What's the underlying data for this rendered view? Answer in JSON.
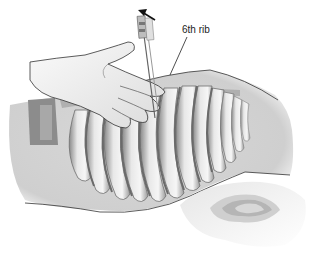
{
  "figure": {
    "labels": [
      {
        "text": "6th rib",
        "x": 182,
        "y": 30
      }
    ],
    "colors": {
      "background": "#ffffff",
      "body_fill": "#d6d6d6",
      "rib_light": "#eeeeee",
      "rib_dark": "#7a7a7a",
      "outline": "#333333",
      "glove": "#f2f2f2"
    },
    "rib_count_visible": 12
  }
}
